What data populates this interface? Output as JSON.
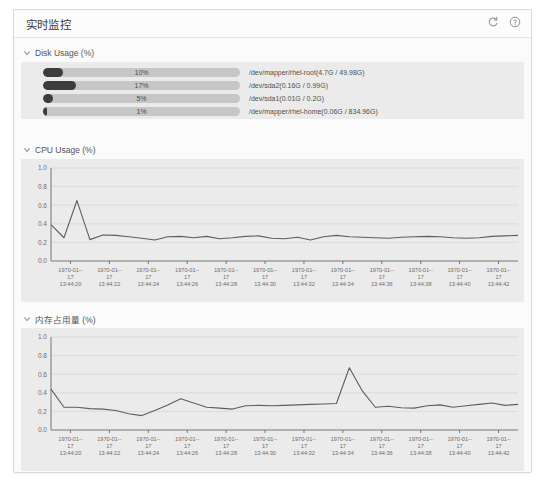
{
  "window": {
    "title": "实时监控",
    "icons": [
      {
        "name": "refresh-icon",
        "label": "refresh"
      },
      {
        "name": "help-icon",
        "label": "help"
      }
    ]
  },
  "sections": {
    "disk": {
      "title": "Disk Usage (%)",
      "chevron": "chevron-down-icon",
      "rows": [
        {
          "percent": "10%",
          "value": 10,
          "label": "/dev/mapper/rhel-root(4.7G / 49.98G)"
        },
        {
          "percent": "17%",
          "value": 17,
          "label": "/dev/sda2(0.16G / 0.99G)"
        },
        {
          "percent": "5%",
          "value": 5,
          "label": "/dev/sda1(0.01G / 0.2G)"
        },
        {
          "percent": "1%",
          "value": 1,
          "label": "/dev/mapper/rhel-home(0.06G / 834.96G)"
        }
      ]
    },
    "cpu": {
      "title": "CPU Usage (%)",
      "chevron": "chevron-down-icon"
    },
    "memory": {
      "title": "内存占用量 (%)",
      "chevron": "chevron-down-icon"
    }
  },
  "chart_data": [
    {
      "id": "cpu",
      "type": "line",
      "title": "CPU Usage (%)",
      "xlabel": "",
      "ylabel": "",
      "ylim": [
        0.0,
        1.0
      ],
      "yticks": [
        "0.0",
        "0.2",
        "0.4",
        "0.6",
        "0.8",
        "1.0"
      ],
      "ytick_values": [
        0.0,
        0.2,
        0.4,
        0.6,
        0.8,
        1.0
      ],
      "grid": true,
      "legend": "none",
      "xtick_labels": [
        "1970-01-17 13:44:20",
        "1970-01-17 13:44:22",
        "1970-01-17 13:44:24",
        "1970-01-17 13:44:26",
        "1970-01-17 13:44:28",
        "1970-01-17 13:44:30",
        "1970-01-17 13:44:32",
        "1970-01-17 13:44:34",
        "1970-01-17 13:44:36",
        "1970-01-17 13:44:38",
        "1970-01-17 13:44:40",
        "1970-01-17 13:44:42"
      ],
      "xtick_date": "1970-01-17",
      "xtick_times": [
        "13:44:20",
        "13:44:22",
        "13:44:24",
        "13:44:26",
        "13:44:28",
        "13:44:30",
        "13:44:32",
        "13:44:34",
        "13:44:36",
        "13:44:38",
        "13:44:40",
        "13:44:42"
      ],
      "values": [
        0.39,
        0.25,
        0.65,
        0.23,
        0.28,
        0.275,
        0.26,
        0.245,
        0.225,
        0.26,
        0.265,
        0.25,
        0.265,
        0.24,
        0.25,
        0.265,
        0.27,
        0.245,
        0.24,
        0.255,
        0.225,
        0.26,
        0.275,
        0.26,
        0.255,
        0.25,
        0.245,
        0.255,
        0.26,
        0.265,
        0.26,
        0.25,
        0.245,
        0.25,
        0.265,
        0.27,
        0.275
      ]
    },
    {
      "id": "memory",
      "type": "line",
      "title": "内存占用量 (%)",
      "xlabel": "",
      "ylabel": "",
      "ylim": [
        0.0,
        1.0
      ],
      "yticks": [
        "0.0",
        "0.2",
        "0.4",
        "0.6",
        "0.8",
        "1.0"
      ],
      "ytick_values": [
        0.0,
        0.2,
        0.4,
        0.6,
        0.8,
        1.0
      ],
      "grid": true,
      "legend": "none",
      "xtick_labels": [
        "1970-01-17 13:44:20",
        "1970-01-17 13:44:22",
        "1970-01-17 13:44:24",
        "1970-01-17 13:44:26",
        "1970-01-17 13:44:28",
        "1970-01-17 13:44:30",
        "1970-01-17 13:44:32",
        "1970-01-17 13:44:34",
        "1970-01-17 13:44:36",
        "1970-01-17 13:44:38",
        "1970-01-17 13:44:40",
        "1970-01-17 13:44:42"
      ],
      "xtick_date": "1970-01-17",
      "xtick_times": [
        "13:44:20",
        "13:44:22",
        "13:44:24",
        "13:44:26",
        "13:44:28",
        "13:44:30",
        "13:44:32",
        "13:44:34",
        "13:44:36",
        "13:44:38",
        "13:44:40",
        "13:44:42"
      ],
      "values": [
        0.44,
        0.245,
        0.245,
        0.23,
        0.225,
        0.21,
        0.175,
        0.155,
        0.21,
        0.27,
        0.335,
        0.29,
        0.245,
        0.235,
        0.225,
        0.26,
        0.265,
        0.26,
        0.265,
        0.27,
        0.275,
        0.28,
        0.285,
        0.67,
        0.42,
        0.245,
        0.255,
        0.24,
        0.235,
        0.26,
        0.27,
        0.245,
        0.26,
        0.275,
        0.29,
        0.265,
        0.275
      ]
    }
  ]
}
